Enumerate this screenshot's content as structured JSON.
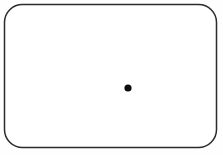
{
  "figure": {
    "background_color": "#fefefe",
    "width": 223,
    "height": 155,
    "label": "rounded rectangle enclosing a single point"
  },
  "shape": {
    "name": "rounded-rectangle",
    "x": 4.5,
    "y": 4.5,
    "width": 212,
    "height": 143,
    "corner_radius": 18,
    "stroke_color": "#2b2b2b",
    "stroke_width": 1.5,
    "fill_color": "#ffffff"
  },
  "point": {
    "name": "interior-point",
    "cx": 128,
    "cy": 88,
    "radius": 3.6,
    "fill_color": "#0d0d0d"
  }
}
